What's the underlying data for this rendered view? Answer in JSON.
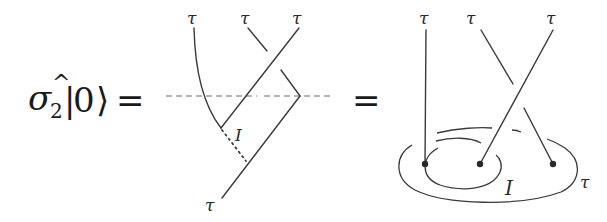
{
  "equation": {
    "lhs_operator": "σ",
    "lhs_hat": "^",
    "lhs_subscript": "2",
    "lhs_ket_open": "|",
    "lhs_ket_value": "0",
    "lhs_ket_close": "⟩",
    "equals_1": "=",
    "equals_2": "="
  },
  "fusion_tree": {
    "top_labels": [
      "τ",
      "τ",
      "τ"
    ],
    "bottom_label": "τ",
    "intermediate_label": "I"
  },
  "anyon_picture": {
    "top_labels": [
      "τ",
      "τ",
      "τ"
    ],
    "inner_loop_label": "I",
    "outer_loop_label": "τ"
  }
}
